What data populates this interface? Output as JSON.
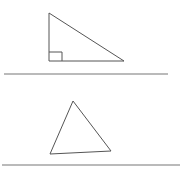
{
  "figures": {
    "right_triangle": {
      "points": "49,13 49,61 124,61",
      "right_angle_marker": "49,52 62,52 62,61",
      "stroke": "#555555"
    },
    "divider_1": {
      "x1": 4,
      "y1": 74,
      "x2": 168,
      "y2": 74,
      "stroke": "#777777"
    },
    "acute_triangle": {
      "points": "73,101 50,154 111,151",
      "stroke": "#555555"
    },
    "divider_2": {
      "x1": 2,
      "y1": 165,
      "x2": 180,
      "y2": 165,
      "stroke": "#777777"
    }
  }
}
